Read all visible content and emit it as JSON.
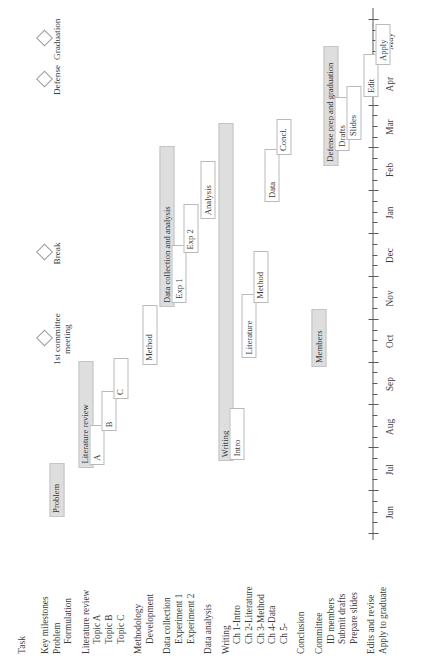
{
  "chart_data": {
    "type": "bar",
    "chart_kind": "gantt",
    "title": "",
    "xlabel": "",
    "ylabel": "Task",
    "axis_header": "Task",
    "grid": false,
    "legend": "none",
    "months": [
      "Jun",
      "Jul",
      "Aug",
      "Sep",
      "Oct",
      "Nov",
      "Dec",
      "Jan",
      "Feb",
      "Mar",
      "Apr",
      "May"
    ],
    "xlim": [
      0,
      12
    ],
    "rows": [
      {
        "label": "Key milestones",
        "kind": "group",
        "indent": 0
      },
      {
        "label": "Problem",
        "kind": "group",
        "indent": 0
      },
      {
        "label": "Formulation",
        "kind": "task",
        "indent": 1
      },
      {
        "label": "Literature review",
        "kind": "group",
        "indent": 0
      },
      {
        "label": "Topic A",
        "kind": "task",
        "indent": 1
      },
      {
        "label": "Topic B",
        "kind": "task",
        "indent": 1
      },
      {
        "label": "Topic C",
        "kind": "task",
        "indent": 1
      },
      {
        "label": "Methodology",
        "kind": "group",
        "indent": 0
      },
      {
        "label": "Development",
        "kind": "task",
        "indent": 1
      },
      {
        "label": "Data collection",
        "kind": "group",
        "indent": 0
      },
      {
        "label": "Experiment 1",
        "kind": "task",
        "indent": 1
      },
      {
        "label": "Experiment 2",
        "kind": "task",
        "indent": 1
      },
      {
        "label": "Data analysis",
        "kind": "task",
        "indent": 0
      },
      {
        "label": "Writing",
        "kind": "group",
        "indent": 0
      },
      {
        "label": "Ch 1-Intro",
        "kind": "task",
        "indent": 1
      },
      {
        "label": "Ch 2-Literature",
        "kind": "task",
        "indent": 1
      },
      {
        "label": "Ch 3-Method",
        "kind": "task",
        "indent": 1
      },
      {
        "label": "Ch 4-Data",
        "kind": "task",
        "indent": 1
      },
      {
        "label": "Ch 5-",
        "kind": "task",
        "indent": 1
      },
      {
        "label": "Conclusion",
        "kind": "task",
        "indent": 0
      },
      {
        "label": "Committee",
        "kind": "group",
        "indent": 0
      },
      {
        "label": "ID members",
        "kind": "task",
        "indent": 1
      },
      {
        "label": "Submit drafts",
        "kind": "task",
        "indent": 1
      },
      {
        "label": "Prepare slides",
        "kind": "task",
        "indent": 1
      },
      {
        "label": "Edits and revise",
        "kind": "task",
        "indent": 0
      },
      {
        "label": "Apply to graduate",
        "kind": "task",
        "indent": 0
      }
    ],
    "bars": [
      {
        "name": "problem-formulation",
        "row": 2,
        "text": "Problem",
        "start": 0.4,
        "end": 1.65,
        "style": "summary",
        "text_pos": "inside"
      },
      {
        "name": "literature-review",
        "row": 4,
        "text": "Literature review",
        "start": 1.55,
        "end": 4.05,
        "style": "summary",
        "text_pos": "inside"
      },
      {
        "name": "topic-a",
        "row": 5,
        "text": "A",
        "start": 1.62,
        "end": 2.55,
        "style": "task",
        "text_pos": "inside"
      },
      {
        "name": "topic-b",
        "row": 6,
        "text": "B",
        "start": 2.4,
        "end": 3.35,
        "style": "task",
        "text_pos": "inside"
      },
      {
        "name": "topic-c",
        "row": 7,
        "text": "C",
        "start": 3.15,
        "end": 4.1,
        "style": "task",
        "text_pos": "inside"
      },
      {
        "name": "methodology-dev",
        "row": 9,
        "text": "Method",
        "start": 3.95,
        "end": 5.35,
        "style": "task",
        "text_pos": "inside"
      },
      {
        "name": "data-collection",
        "row": 10,
        "text": "Data collection and analysis",
        "start": 5.3,
        "end": 9.05,
        "style": "summary",
        "text_pos": "inside"
      },
      {
        "name": "experiment-1",
        "row": 11,
        "text": "Exp 1",
        "start": 5.4,
        "end": 6.75,
        "style": "task",
        "text_pos": "inside"
      },
      {
        "name": "experiment-2",
        "row": 12,
        "text": "Exp 2",
        "start": 6.55,
        "end": 7.7,
        "style": "task",
        "text_pos": "inside"
      },
      {
        "name": "data-analysis",
        "row": 13,
        "text": "Analysis",
        "start": 7.35,
        "end": 8.7,
        "style": "task",
        "text_pos": "inside"
      },
      {
        "name": "writing",
        "row": 14,
        "text": "Writing",
        "start": 1.7,
        "end": 9.6,
        "style": "summary",
        "text_pos": "inside"
      },
      {
        "name": "ch1-intro",
        "row": 15,
        "text": "Intro",
        "start": 1.72,
        "end": 2.95,
        "style": "task",
        "text_pos": "inside"
      },
      {
        "name": "ch2-literature",
        "row": 16,
        "text": "Literature",
        "start": 4.1,
        "end": 5.6,
        "style": "task",
        "text_pos": "inside"
      },
      {
        "name": "ch3-method",
        "row": 17,
        "text": "Method",
        "start": 5.4,
        "end": 6.6,
        "style": "task",
        "text_pos": "inside"
      },
      {
        "name": "ch4-data",
        "row": 18,
        "text": "Data",
        "start": 7.75,
        "end": 9.0,
        "style": "task",
        "text_pos": "inside"
      },
      {
        "name": "ch5-conclusion",
        "row": 19,
        "text": "Concl.",
        "start": 8.85,
        "end": 9.7,
        "style": "task",
        "text_pos": "inside"
      },
      {
        "name": "committee-members",
        "row": 21,
        "text": "Members",
        "start": 3.9,
        "end": 5.25,
        "style": "summary",
        "text_pos": "inside"
      },
      {
        "name": "defense-prep",
        "row": 22,
        "text": "Defense prep and graduation",
        "start": 8.6,
        "end": 11.4,
        "style": "summary",
        "text_pos": "inside"
      },
      {
        "name": "submit-drafts",
        "row": 23,
        "text": "Drafts",
        "start": 8.95,
        "end": 10.2,
        "style": "task",
        "text_pos": "inside"
      },
      {
        "name": "prepare-slides",
        "row": 24,
        "text": "Slides",
        "start": 9.2,
        "end": 10.45,
        "style": "task",
        "text_pos": "inside"
      },
      {
        "name": "edits-and-revise",
        "row": 25,
        "text": "Edit",
        "start": 10.2,
        "end": 11.2,
        "style": "task",
        "text_pos": "inside"
      },
      {
        "name": "apply-to-graduate",
        "row": 26,
        "text": "Apply",
        "start": 10.95,
        "end": 11.9,
        "style": "task",
        "text_pos": "inside"
      }
    ],
    "milestones": [
      {
        "name": "first-committee-meeting",
        "label": "1st committee meeting",
        "month": 4.55,
        "row": 1
      },
      {
        "name": "break",
        "label": "Break",
        "month": 6.55,
        "row": 1
      },
      {
        "name": "defense",
        "label": "Defense",
        "month": 10.6,
        "row": 1
      },
      {
        "name": "graduation",
        "label": "Graduation",
        "month": 11.55,
        "row": 1
      }
    ]
  }
}
